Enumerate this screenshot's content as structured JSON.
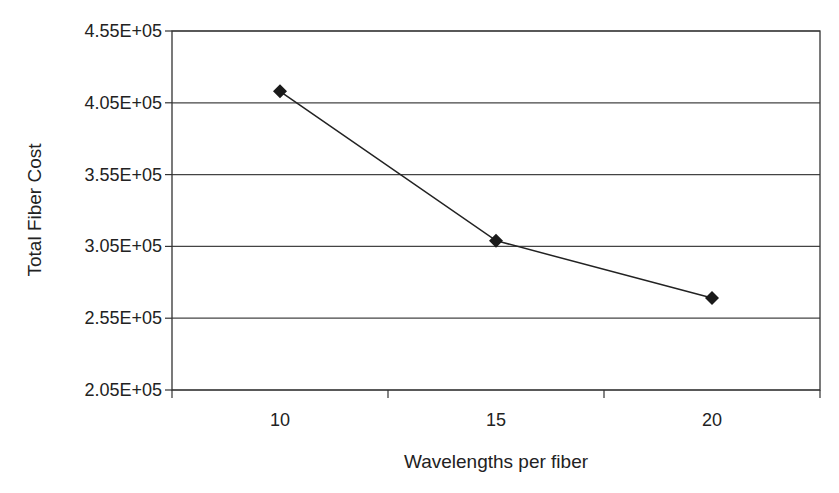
{
  "chart_data": {
    "type": "line",
    "title": "",
    "xlabel": "Wavelengths per fiber",
    "ylabel": "Total Fiber Cost",
    "categories": [
      "10",
      "15",
      "20"
    ],
    "series": [
      {
        "name": "Total Fiber Cost",
        "values": [
          413000,
          309000,
          269000
        ],
        "marker": "diamond",
        "color": "#1a1a1a"
      }
    ],
    "ylim": [
      205000,
      455000
    ],
    "yticks": [
      205000,
      255000,
      305000,
      355000,
      405000,
      455000
    ],
    "ytick_labels": [
      "2.05E+05",
      "2.55E+05",
      "3.05E+05",
      "3.55E+05",
      "4.05E+05",
      "4.55E+05"
    ],
    "grid": "horizontal",
    "legend": "none"
  }
}
